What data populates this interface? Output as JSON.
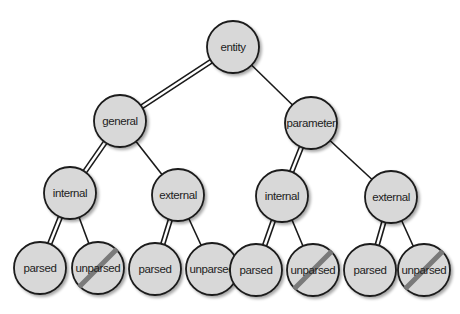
{
  "diagram": {
    "type": "tree",
    "title": "",
    "colors": {
      "node_fill": "#d8d8d8",
      "node_stroke": "#1a1a1a",
      "edge": "#1a1a1a",
      "slash": "#7a7a7a",
      "background": "#ffffff"
    },
    "nodes": [
      {
        "id": "entity",
        "label": "entity",
        "x": 233,
        "y": 47,
        "crossed": false
      },
      {
        "id": "general",
        "label": "general",
        "x": 120,
        "y": 121,
        "crossed": false
      },
      {
        "id": "parameter",
        "label": "parameter",
        "x": 311,
        "y": 123,
        "crossed": false
      },
      {
        "id": "general-internal",
        "label": "internal",
        "x": 70,
        "y": 193,
        "crossed": false
      },
      {
        "id": "general-external",
        "label": "external",
        "x": 178,
        "y": 195,
        "crossed": false
      },
      {
        "id": "parameter-internal",
        "label": "internal",
        "x": 282,
        "y": 196,
        "crossed": false
      },
      {
        "id": "parameter-external",
        "label": "external",
        "x": 391,
        "y": 197,
        "crossed": false
      },
      {
        "id": "gi-parsed",
        "label": "parsed",
        "x": 40,
        "y": 268,
        "crossed": false
      },
      {
        "id": "gi-unparsed",
        "label": "unparsed",
        "x": 98,
        "y": 268,
        "crossed": true
      },
      {
        "id": "ge-parsed",
        "label": "parsed",
        "x": 155,
        "y": 269,
        "crossed": false
      },
      {
        "id": "ge-unparsed",
        "label": "unparsed",
        "x": 212,
        "y": 269,
        "crossed": false
      },
      {
        "id": "pi-parsed",
        "label": "parsed",
        "x": 256,
        "y": 270,
        "crossed": false
      },
      {
        "id": "pi-unparsed",
        "label": "unparsed",
        "x": 313,
        "y": 270,
        "crossed": true
      },
      {
        "id": "pe-parsed",
        "label": "parsed",
        "x": 370,
        "y": 270,
        "crossed": false
      },
      {
        "id": "pe-unparsed",
        "label": "unparsed",
        "x": 424,
        "y": 270,
        "crossed": true
      }
    ],
    "edges": [
      {
        "from": "entity",
        "to": "general",
        "double": true
      },
      {
        "from": "entity",
        "to": "parameter",
        "double": false
      },
      {
        "from": "general",
        "to": "general-internal",
        "double": true
      },
      {
        "from": "general",
        "to": "general-external",
        "double": false
      },
      {
        "from": "parameter",
        "to": "parameter-internal",
        "double": true
      },
      {
        "from": "parameter",
        "to": "parameter-external",
        "double": false
      },
      {
        "from": "general-internal",
        "to": "gi-parsed",
        "double": true
      },
      {
        "from": "general-internal",
        "to": "gi-unparsed",
        "double": false
      },
      {
        "from": "general-external",
        "to": "ge-parsed",
        "double": true
      },
      {
        "from": "general-external",
        "to": "ge-unparsed",
        "double": false
      },
      {
        "from": "parameter-internal",
        "to": "pi-parsed",
        "double": true
      },
      {
        "from": "parameter-internal",
        "to": "pi-unparsed",
        "double": false
      },
      {
        "from": "parameter-external",
        "to": "pe-parsed",
        "double": true
      },
      {
        "from": "parameter-external",
        "to": "pe-unparsed",
        "double": false
      }
    ],
    "node_radius": 26
  }
}
